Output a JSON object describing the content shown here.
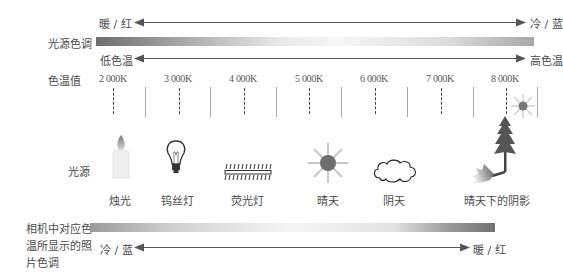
{
  "top_scale": {
    "warm_label": "暖 / 红",
    "cool_label": "冷 / 蓝",
    "row_label": "光源色调",
    "low_label": "低色温",
    "high_label": "高色温"
  },
  "temperature_row": {
    "label": "色温值",
    "ticks": [
      "2 000K",
      "3 000K",
      "4 000K",
      "5 000K",
      "6 000K",
      "7 000K",
      "8 000K"
    ]
  },
  "light_sources": {
    "label": "光源",
    "items": [
      {
        "name": "烛光",
        "icon": "candle-icon"
      },
      {
        "name": "钨丝灯",
        "icon": "light-bulb-icon"
      },
      {
        "name": "荧光灯",
        "icon": "fluorescent-tube-icon"
      },
      {
        "name": "晴天",
        "icon": "sun-icon"
      },
      {
        "name": "阴天",
        "icon": "cloud-icon"
      },
      {
        "name": "晴天下的阴影",
        "icon": "tree-shadow-icon"
      }
    ]
  },
  "bottom_scale": {
    "label_line1": "相机中对应色",
    "label_line2": "温所显示的照",
    "label_line3": "片色调",
    "cool_label": "冷 / 蓝",
    "warm_label": "暖 / 红"
  }
}
